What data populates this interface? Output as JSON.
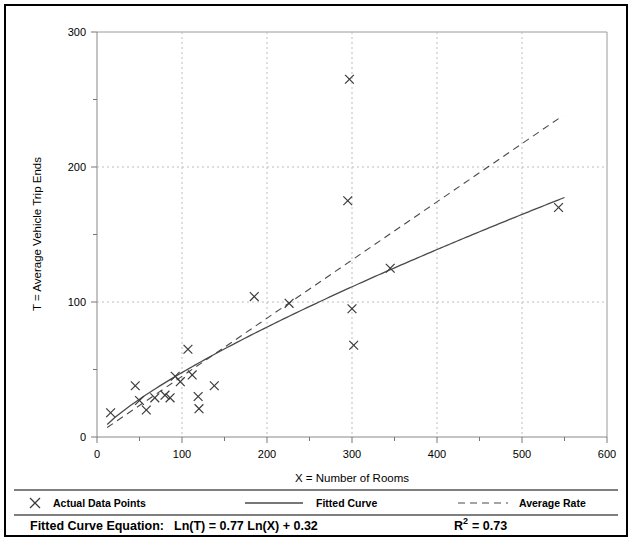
{
  "chart_data": {
    "type": "scatter",
    "title": "",
    "xlabel": "X = Number of Rooms",
    "ylabel": "T = Average Vehicle Trip Ends",
    "xlim": [
      0,
      600
    ],
    "ylim": [
      0,
      300
    ],
    "xticks": [
      0,
      100,
      200,
      300,
      400,
      500,
      600
    ],
    "xticklabels": [
      "0",
      "100",
      "200",
      "300",
      "400",
      "500",
      "600"
    ],
    "xminorticks": [
      50,
      150,
      250,
      350,
      450,
      550
    ],
    "yticks": [
      0,
      100,
      200,
      300
    ],
    "yticklabels": [
      "0",
      "100",
      "200",
      "300"
    ],
    "yminorticks": [
      50,
      150,
      250
    ],
    "grid": "dotted vertical at major x, dotted horizontal at y=100,200,300",
    "legend_position": "below-axes",
    "series": [
      {
        "name": "Actual Data Points",
        "type": "scatter",
        "marker": "x",
        "points": [
          [
            16,
            18
          ],
          [
            45,
            38
          ],
          [
            50,
            27
          ],
          [
            58,
            20
          ],
          [
            68,
            29
          ],
          [
            80,
            31
          ],
          [
            86,
            29
          ],
          [
            92,
            45
          ],
          [
            98,
            41
          ],
          [
            107,
            65
          ],
          [
            112,
            46
          ],
          [
            119,
            30
          ],
          [
            120,
            21
          ],
          [
            138,
            38
          ],
          [
            185,
            104
          ],
          [
            226,
            99
          ],
          [
            295,
            175
          ],
          [
            297,
            265
          ],
          [
            300,
            95
          ],
          [
            302,
            68
          ],
          [
            345,
            125
          ],
          [
            543,
            170
          ]
        ]
      },
      {
        "name": "Fitted Curve",
        "type": "line",
        "style": "solid",
        "equation": "Ln(T) = 0.77 Ln(X) + 0.32",
        "a": 1.377,
        "b": 0.77,
        "x_range": [
          12,
          550
        ]
      },
      {
        "name": "Average Rate",
        "type": "line",
        "style": "dashed",
        "x_range": [
          12,
          548
        ],
        "y_range": [
          7,
          238
        ]
      }
    ]
  },
  "legend": {
    "items": [
      {
        "label": "Actual Data Points",
        "marker": "x-marker"
      },
      {
        "label": "Fitted Curve",
        "marker": "solid-line"
      },
      {
        "label": "Average Rate",
        "marker": "dashed-line"
      }
    ]
  },
  "footer": {
    "equation_label": "Fitted Curve Equation:",
    "equation": "Ln(T) = 0.77 Ln(X) + 0.32",
    "r_squared_base": "R",
    "r_squared_exp": "2",
    "r_squared_value": "= 0.73"
  }
}
